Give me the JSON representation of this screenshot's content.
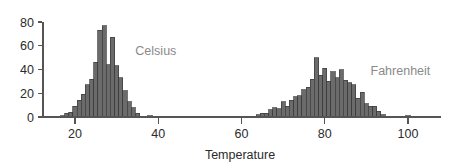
{
  "chart_data": {
    "type": "bar",
    "title": "",
    "subtitle": "",
    "xlabel": "Temperature",
    "ylabel": "",
    "xlim": [
      12,
      108
    ],
    "ylim": [
      0,
      84
    ],
    "grid": false,
    "legend_position": "inline-annotation",
    "x_ticks": [
      20,
      40,
      60,
      80,
      100
    ],
    "x_tick_labels": [
      "20",
      "40",
      "60",
      "80",
      "100"
    ],
    "y_ticks": [
      0,
      20,
      40,
      60,
      80
    ],
    "y_tick_labels": [
      "0",
      "20",
      "40",
      "60",
      "80"
    ],
    "bar_color": "#6b6b6b",
    "bar_edge_color": "#3a3a3a",
    "axis_color": "#555555",
    "annotation_color": "#8a8a8a",
    "bin_width": 1,
    "annotations": [
      {
        "text": "Celsius",
        "x": 34.5,
        "y": 52
      },
      {
        "text": "Fahrenheit",
        "x": 91.0,
        "y": 35
      }
    ],
    "series": [
      {
        "name": "Celsius",
        "x": [
          17,
          18,
          19,
          20,
          21,
          22,
          23,
          24,
          25,
          26,
          27,
          28,
          29,
          30,
          31,
          32,
          33,
          34,
          35,
          38
        ],
        "values": [
          1,
          3,
          4,
          9,
          14,
          19,
          27,
          32,
          46,
          73,
          77,
          44,
          67,
          43,
          33,
          22,
          13,
          8,
          3,
          1
        ]
      },
      {
        "name": "Fahrenheit",
        "x": [
          64,
          65,
          66,
          67,
          68,
          69,
          70,
          71,
          72,
          73,
          74,
          75,
          76,
          77,
          78,
          79,
          80,
          81,
          82,
          83,
          84,
          85,
          86,
          87,
          88,
          89,
          90,
          91,
          92,
          93,
          94,
          100
        ],
        "values": [
          2,
          3,
          3,
          6,
          8,
          7,
          13,
          9,
          14,
          17,
          18,
          23,
          25,
          32,
          50,
          35,
          41,
          30,
          38,
          33,
          40,
          31,
          29,
          27,
          16,
          21,
          11,
          9,
          9,
          5,
          2,
          1
        ]
      }
    ]
  }
}
